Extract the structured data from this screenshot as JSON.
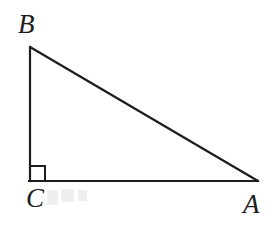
{
  "figure": {
    "type": "geometry-diagram",
    "shape": "right-triangle",
    "background_color": "#ffffff",
    "stroke_color": "#1d1d1f",
    "stroke_width": 2.2,
    "vertices": [
      {
        "id": "B",
        "label": "B",
        "x": 30,
        "y": 47,
        "label_x": 18,
        "label_y": 11
      },
      {
        "id": "C",
        "label": "C",
        "x": 30,
        "y": 181,
        "label_x": 26,
        "label_y": 185
      },
      {
        "id": "A",
        "label": "A",
        "x": 258,
        "y": 181,
        "label_x": 243,
        "label_y": 191
      }
    ],
    "sides": [
      {
        "id": "BC",
        "from": "B",
        "to": "C",
        "name": "vertical-leg"
      },
      {
        "id": "CA",
        "from": "C",
        "to": "A",
        "name": "horizontal-leg"
      },
      {
        "id": "AB",
        "from": "A",
        "to": "B",
        "name": "hypotenuse"
      }
    ],
    "right_angle": {
      "at_vertex": "C",
      "marker": "square",
      "size": 15,
      "x": 30,
      "y": 181
    },
    "artifacts": {
      "note": "faint light-grey scan speckles to the right of label C"
    }
  }
}
